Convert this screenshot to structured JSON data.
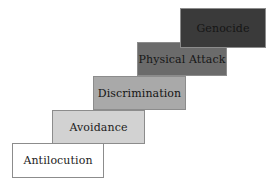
{
  "diagram": {
    "type": "ascending-staircase",
    "background_color": "#ffffff",
    "border_color": "#8c8c8c",
    "steps": [
      {
        "order": 1,
        "label": "Antilocution",
        "fill_color": "#ffffff",
        "text_color": "#1c1c1c"
      },
      {
        "order": 2,
        "label": "Avoidance",
        "fill_color": "#d2d2d2",
        "text_color": "#1c1c1c"
      },
      {
        "order": 3,
        "label": "Discrimination",
        "fill_color": "#a9a9a9",
        "text_color": "#141414"
      },
      {
        "order": 4,
        "label": "Physical Attack",
        "fill_color": "#6b6b6b",
        "text_color": "#161616"
      },
      {
        "order": 5,
        "label": "Genocide",
        "fill_color": "#3a3a3a",
        "text_color": "#151515"
      }
    ]
  }
}
